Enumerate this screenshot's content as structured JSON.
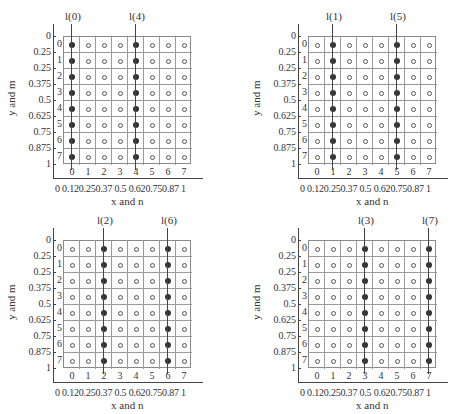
{
  "chart_data": [
    {
      "type": "diagram",
      "panel": "top-left",
      "lines": [
        "l(0)",
        "l(4)"
      ],
      "highlighted_columns": [
        0,
        4
      ]
    },
    {
      "type": "diagram",
      "panel": "top-right",
      "lines": [
        "l(1)",
        "l(5)"
      ],
      "highlighted_columns": [
        1,
        5
      ]
    },
    {
      "type": "diagram",
      "panel": "bottom-left",
      "lines": [
        "l(2)",
        "l(6)"
      ],
      "highlighted_columns": [
        2,
        6
      ]
    },
    {
      "type": "diagram",
      "panel": "bottom-right",
      "lines": [
        "l(3)",
        "l(7)"
      ],
      "highlighted_columns": [
        3,
        7
      ]
    }
  ],
  "common": {
    "xlabel": "x and n",
    "ylabel": "y and m",
    "x_ticks": [
      "0",
      "0.12",
      "0.25",
      "0.37",
      "0.5",
      "0.62",
      "0.75",
      "0.87",
      "1"
    ],
    "x_tick_string": "0  0.120.250.37 0.5 0.620.750.87  1",
    "y_ticks": [
      "0",
      "0.25",
      "0.25",
      "0.375",
      "0.5",
      "0.625",
      "0.75",
      "0.875",
      "1"
    ],
    "col_labels": [
      "0",
      "1",
      "2",
      "3",
      "4",
      "5",
      "6",
      "7"
    ],
    "row_labels": [
      "0",
      "1",
      "2",
      "3",
      "4",
      "5",
      "6",
      "7"
    ],
    "grid_size": 8
  },
  "panels": [
    {
      "id": "p0",
      "left": 0,
      "top": 0,
      "grid_x": 63,
      "grid_y": 36,
      "line_labels": [
        "l(0)",
        "l(4)"
      ],
      "cols": [
        0,
        4
      ]
    },
    {
      "id": "p1",
      "left": 231,
      "top": 0,
      "grid_x": 77,
      "grid_y": 36,
      "line_labels": [
        "l(1)",
        "l(5)"
      ],
      "cols": [
        1,
        5
      ]
    },
    {
      "id": "p2",
      "left": 0,
      "top": 207,
      "grid_x": 63,
      "grid_y": 33,
      "line_labels": [
        "l(2)",
        "l(6)"
      ],
      "cols": [
        2,
        6
      ]
    },
    {
      "id": "p3",
      "left": 231,
      "top": 207,
      "grid_x": 77,
      "grid_y": 33,
      "line_labels": [
        "l(3)",
        "l(7)"
      ],
      "cols": [
        3,
        7
      ]
    }
  ]
}
